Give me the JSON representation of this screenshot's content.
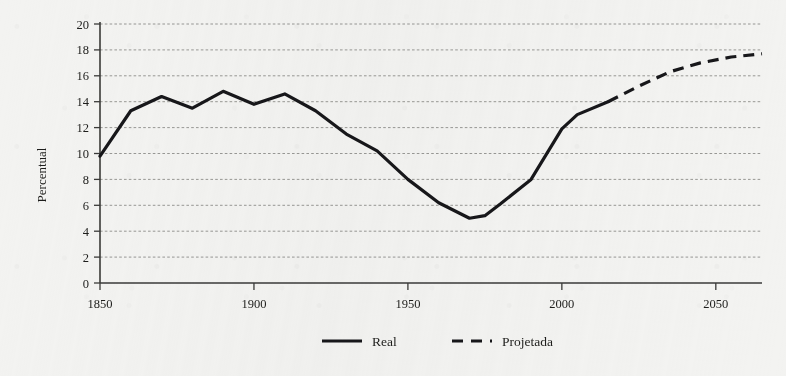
{
  "chart_data": {
    "type": "line",
    "title": "",
    "xlabel": "",
    "ylabel": "Percentual",
    "xlim": [
      1850,
      2065
    ],
    "ylim": [
      0,
      20
    ],
    "grid": true,
    "legend_position": "bottom-center",
    "xticks": [
      1850,
      1900,
      1950,
      2000,
      2050
    ],
    "xtick_labels": [
      "1850",
      "1900",
      "1950",
      "2000",
      "2050"
    ],
    "yticks": [
      0,
      2,
      4,
      6,
      8,
      10,
      12,
      14,
      16,
      18,
      20
    ],
    "ytick_labels": [
      "0",
      "2",
      "4",
      "6",
      "8",
      "10",
      "12",
      "14",
      "16",
      "18",
      "20"
    ],
    "series": [
      {
        "name": "Real",
        "style": "solid",
        "color": "#17171a",
        "x": [
          1850,
          1860,
          1870,
          1880,
          1890,
          1900,
          1910,
          1920,
          1930,
          1940,
          1950,
          1960,
          1970,
          1975,
          1980,
          1990,
          2000,
          2005,
          2015
        ],
        "values": [
          9.8,
          13.3,
          14.4,
          13.5,
          14.8,
          13.8,
          14.6,
          13.3,
          11.5,
          10.2,
          8.0,
          6.2,
          5.0,
          5.2,
          6.1,
          8.0,
          11.9,
          13.0,
          14.0
        ]
      },
      {
        "name": "Projetada",
        "style": "dashed",
        "color": "#17171a",
        "x": [
          2015,
          2025,
          2035,
          2045,
          2055,
          2065
        ],
        "values": [
          14.0,
          15.2,
          16.3,
          17.0,
          17.45,
          17.7
        ]
      }
    ]
  },
  "legend": {
    "entries": [
      {
        "label": "Real",
        "style": "solid"
      },
      {
        "label": "Projetada",
        "style": "dashed"
      }
    ]
  }
}
